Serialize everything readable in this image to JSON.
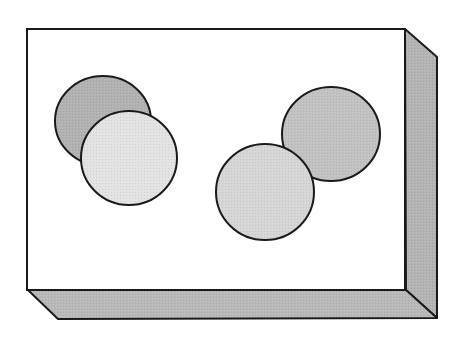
{
  "diagram": {
    "title": "",
    "box": {
      "front_face": {
        "x1": 27,
        "y1": 29,
        "x2": 405,
        "y2": 290,
        "fill": "#ffffff"
      },
      "side_face": {
        "points": "405,29 437,57 437,318 406,290",
        "fill": "#b4b4b4"
      },
      "bottom_face": {
        "points": "28,290 406,290 437,318 58,319",
        "fill": "#b9b9b9"
      },
      "stroke": "#1a1a1a"
    },
    "circles": [
      {
        "id": "left-back-circle",
        "cx": 103,
        "cy": 121,
        "rx": 48,
        "ry": 45,
        "fill": "#b2b2b2"
      },
      {
        "id": "left-front-circle",
        "cx": 129,
        "cy": 158,
        "rx": 48,
        "ry": 47,
        "fill": "#e3e3e3"
      },
      {
        "id": "right-back-circle",
        "cx": 331,
        "cy": 134,
        "rx": 49,
        "ry": 47,
        "fill": "#c2c2c2"
      },
      {
        "id": "right-front-circle",
        "cx": 265,
        "cy": 192,
        "rx": 49,
        "ry": 48,
        "fill": "#d6d6d6"
      }
    ]
  }
}
